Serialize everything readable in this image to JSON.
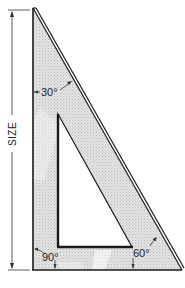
{
  "diagram": {
    "dimension_label": "SIZE",
    "angles": [
      {
        "id": "top",
        "label": "30°"
      },
      {
        "id": "bottom-left",
        "label": "90°"
      },
      {
        "id": "bottom-right",
        "label": "60°"
      }
    ],
    "colors": {
      "stroke": "#1a1a1a",
      "fill": "#d9d9d9",
      "background": "#ffffff"
    }
  }
}
